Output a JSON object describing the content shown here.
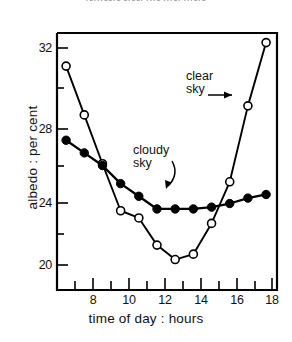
{
  "figure": {
    "cut_off_title": "rerrreere ereer rrre rrrer rrrere",
    "background_color": "#ffffff",
    "line_color": "#000000"
  },
  "axes": {
    "x": {
      "title": "time of day : hours",
      "tick_labels": [
        "8",
        "10",
        "12",
        "14",
        "16",
        "18"
      ],
      "tick_values": [
        8,
        10,
        12,
        14,
        16,
        18
      ],
      "minor_tick_values": [
        7,
        9,
        11,
        13,
        15,
        17,
        18
      ],
      "range": [
        6.5,
        18.6
      ]
    },
    "y": {
      "title": "albedo : per cent",
      "tick_labels": [
        "32",
        "28",
        "24",
        "20"
      ],
      "tick_values": [
        32,
        28,
        24,
        20
      ],
      "minor_tick_values": [
        30,
        26,
        22
      ],
      "range": [
        18.8,
        33.2
      ]
    }
  },
  "annotations": [
    {
      "name": "clear-sky",
      "text": "clear\nsky",
      "target": "clear sky series"
    },
    {
      "name": "cloudy-sky",
      "text": "cloudy\nsky",
      "target": "cloudy sky series"
    }
  ],
  "chart_data": {
    "type": "line",
    "title": "",
    "xlabel": "time of day : hours",
    "ylabel": "albedo : per cent",
    "xlim": [
      6.5,
      18.6
    ],
    "ylim": [
      18.8,
      33.2
    ],
    "grid": false,
    "legend": "annotated inline",
    "series": [
      {
        "name": "clear sky",
        "marker": "open-circle",
        "x": [
          7,
          8,
          9,
          10,
          11,
          12,
          13,
          14,
          15,
          16,
          17,
          18
        ],
        "values": [
          31.0,
          28.3,
          25.6,
          23.0,
          22.6,
          21.1,
          20.3,
          20.6,
          22.3,
          24.6,
          28.8,
          32.3
        ]
      },
      {
        "name": "cloudy sky",
        "marker": "filled-circle",
        "x": [
          7,
          8,
          9,
          10,
          11,
          12,
          13,
          14,
          15,
          16,
          17,
          18
        ],
        "values": [
          26.9,
          26.2,
          25.5,
          24.5,
          23.8,
          23.1,
          23.1,
          23.1,
          23.2,
          23.4,
          23.7,
          23.9
        ]
      }
    ]
  }
}
